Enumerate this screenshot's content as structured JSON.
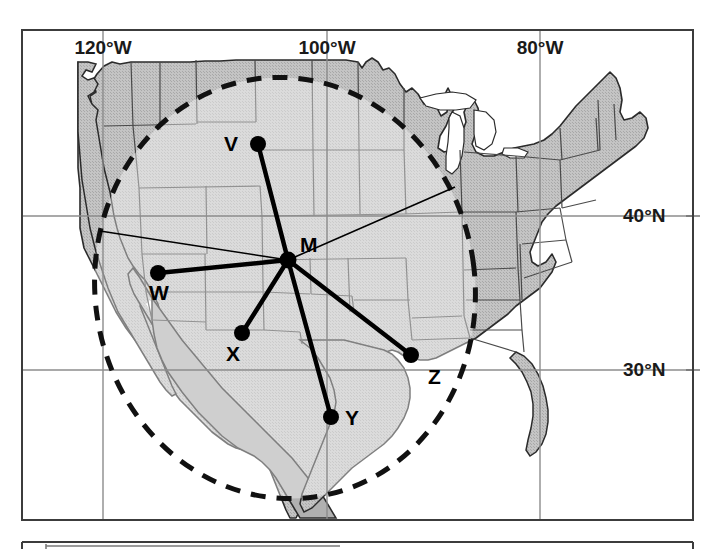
{
  "figure": {
    "type": "map",
    "title": "",
    "background_color": "#ffffff",
    "frame": {
      "x": 22,
      "y": 30,
      "width": 671,
      "height": 490,
      "stroke": "#3c3c3c"
    },
    "second_panel_top_y": 542
  },
  "map": {
    "region": "Contiguous United States and northern Mexico",
    "land_fill": "#b8b8b8",
    "land_fill_light": "#d8d8d8",
    "state_border_color": "#4a4a4a",
    "coastline_color": "#2b2b2b",
    "water_fill": "#ffffff"
  },
  "graticule": {
    "color": "#808080",
    "longitude_ticks": [
      {
        "label": "120°W",
        "x": 103,
        "label_x": 103,
        "label_y": 52,
        "anchor": "middle"
      },
      {
        "label": "100°W",
        "x": 327,
        "label_x": 327,
        "label_y": 52,
        "anchor": "middle"
      },
      {
        "label": "80°W",
        "x": 540,
        "label_x": 540,
        "label_y": 52,
        "anchor": "middle"
      }
    ],
    "latitude_ticks": [
      {
        "label": "40°N",
        "y": 216,
        "label_x": 623,
        "label_y": 222,
        "anchor": "start"
      },
      {
        "label": "30°N",
        "y": 370,
        "label_x": 623,
        "label_y": 376,
        "anchor": "start"
      }
    ]
  },
  "network": {
    "hub": {
      "id": "M",
      "label": "M",
      "x": 288,
      "y": 260,
      "label_x": 300,
      "label_y": 252
    },
    "stations": [
      {
        "id": "V",
        "label": "V",
        "x": 258,
        "y": 144,
        "label_x": 238,
        "label_y": 151
      },
      {
        "id": "W",
        "label": "W",
        "x": 158,
        "y": 273,
        "label_x": 159,
        "label_y": 300
      },
      {
        "id": "X",
        "label": "X",
        "x": 242,
        "y": 333,
        "label_x": 233,
        "label_y": 361
      },
      {
        "id": "Y",
        "label": "Y",
        "x": 331,
        "y": 417,
        "label_x": 345,
        "label_y": 425
      },
      {
        "id": "Z",
        "label": "Z",
        "x": 411,
        "y": 355,
        "label_x": 428,
        "label_y": 384
      }
    ],
    "links": [
      {
        "from": "M",
        "to": "V"
      },
      {
        "from": "M",
        "to": "W"
      },
      {
        "from": "M",
        "to": "X"
      },
      {
        "from": "M",
        "to": "Y"
      },
      {
        "from": "M",
        "to": "Z"
      }
    ],
    "extra_rays": [
      {
        "from": "M",
        "x2": 100,
        "y2": 231
      },
      {
        "from": "M",
        "x2": 455,
        "y2": 187
      }
    ],
    "node_color": "#000000",
    "node_radius": 8,
    "link_color": "#000000",
    "link_width": 4
  },
  "coverage_ellipse": {
    "cx": 285,
    "cy": 288,
    "rx": 190,
    "ry": 211,
    "rotation_deg": -8,
    "stroke": "#111111",
    "stroke_width": 5,
    "dash": "15 11",
    "fill": "#e8e8e8",
    "fill_opacity": 0.42
  }
}
